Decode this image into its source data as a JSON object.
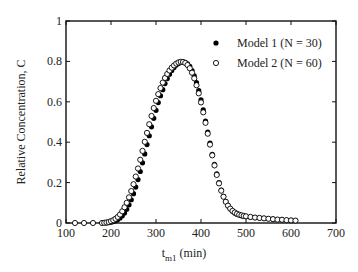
{
  "chart_data": {
    "type": "scatter",
    "title": "",
    "xlabel": "t",
    "xlabel_sub": "m1",
    "xlabel_unit": " (min)",
    "ylabel": "Relative Concentration, C",
    "xlim": [
      100,
      700
    ],
    "ylim": [
      0,
      1
    ],
    "xticks": [
      100,
      200,
      300,
      400,
      500,
      600,
      700
    ],
    "yticks": [
      0,
      0.2,
      0.4,
      0.6,
      0.8,
      1
    ],
    "ytick_labels": [
      "0",
      "0.2",
      "0.4",
      "0.6",
      "0.8",
      "1"
    ],
    "grid": false,
    "legend_position": "upper right",
    "series": [
      {
        "name": "Model 1 (N = 30)",
        "marker": "filled-circle",
        "color": "#000000",
        "x": [
          190,
          195,
          200,
          205,
          210,
          215,
          220,
          225,
          230,
          235,
          240,
          245,
          250,
          255,
          260,
          265,
          270,
          275,
          280,
          285,
          290,
          295,
          300,
          305,
          310,
          315,
          320,
          325,
          330,
          335,
          340,
          345,
          350,
          355,
          360,
          365,
          370,
          375,
          380,
          385,
          390,
          395,
          400,
          405,
          410,
          415,
          420,
          425,
          430,
          435,
          440,
          445,
          450,
          455,
          460,
          465,
          470,
          475,
          480,
          485,
          490,
          495,
          500,
          510,
          520,
          530,
          540,
          550,
          560,
          570,
          580,
          590,
          600,
          610
        ],
        "y": [
          0.0,
          0.002,
          0.004,
          0.007,
          0.011,
          0.017,
          0.025,
          0.036,
          0.05,
          0.068,
          0.09,
          0.115,
          0.145,
          0.178,
          0.215,
          0.255,
          0.298,
          0.342,
          0.388,
          0.432,
          0.476,
          0.518,
          0.558,
          0.596,
          0.63,
          0.66,
          0.69,
          0.715,
          0.737,
          0.755,
          0.77,
          0.782,
          0.79,
          0.795,
          0.797,
          0.795,
          0.788,
          0.775,
          0.755,
          0.728,
          0.695,
          0.655,
          0.61,
          0.56,
          0.505,
          0.45,
          0.395,
          0.34,
          0.29,
          0.243,
          0.2,
          0.163,
          0.132,
          0.106,
          0.086,
          0.07,
          0.058,
          0.049,
          0.043,
          0.039,
          0.036,
          0.034,
          0.032,
          0.029,
          0.027,
          0.025,
          0.023,
          0.021,
          0.019,
          0.017,
          0.016,
          0.014,
          0.013,
          0.012
        ]
      },
      {
        "name": "Model 2 (N = 60)",
        "marker": "open-circle",
        "color": "#000000",
        "x": [
          120,
          140,
          160,
          180,
          185,
          190,
          195,
          200,
          205,
          210,
          215,
          220,
          225,
          230,
          235,
          240,
          245,
          250,
          255,
          260,
          265,
          270,
          275,
          280,
          285,
          290,
          295,
          300,
          305,
          310,
          315,
          320,
          325,
          330,
          335,
          340,
          345,
          350,
          355,
          360,
          365,
          370,
          375,
          380,
          385,
          390,
          395,
          400,
          405,
          410,
          415,
          420,
          425,
          430,
          435,
          440,
          445,
          450,
          455,
          460,
          465,
          470,
          475,
          480,
          485,
          490,
          495,
          500,
          510,
          520,
          530,
          540,
          550,
          560,
          570,
          580,
          590,
          600,
          610
        ],
        "y": [
          0,
          0,
          0,
          0,
          0.001,
          0.003,
          0.005,
          0.009,
          0.014,
          0.021,
          0.03,
          0.042,
          0.058,
          0.078,
          0.1,
          0.127,
          0.158,
          0.192,
          0.23,
          0.27,
          0.313,
          0.357,
          0.402,
          0.446,
          0.489,
          0.53,
          0.569,
          0.605,
          0.638,
          0.668,
          0.695,
          0.718,
          0.738,
          0.755,
          0.769,
          0.78,
          0.789,
          0.795,
          0.798,
          0.797,
          0.792,
          0.782,
          0.766,
          0.744,
          0.716,
          0.682,
          0.642,
          0.597,
          0.548,
          0.496,
          0.442,
          0.388,
          0.335,
          0.285,
          0.238,
          0.196,
          0.16,
          0.13,
          0.105,
          0.086,
          0.071,
          0.06,
          0.052,
          0.046,
          0.041,
          0.038,
          0.035,
          0.033,
          0.03,
          0.027,
          0.025,
          0.023,
          0.021,
          0.019,
          0.017,
          0.016,
          0.014,
          0.013,
          0.012
        ]
      }
    ]
  },
  "legend": {
    "items": [
      {
        "label": "Model 1 (N = 30)",
        "marker": "filled-circle"
      },
      {
        "label": "Model 2 (N = 60)",
        "marker": "open-circle"
      }
    ]
  },
  "axes": {
    "y_label": "Relative Concentration, C",
    "x_label_main": "t",
    "x_label_sub": "m1",
    "x_label_unit": "(min)",
    "x_tick_labels": [
      "100",
      "200",
      "300",
      "400",
      "500",
      "600",
      "700"
    ],
    "y_tick_labels": [
      "0",
      "0.2",
      "0.4",
      "0.6",
      "0.8",
      "1"
    ]
  }
}
